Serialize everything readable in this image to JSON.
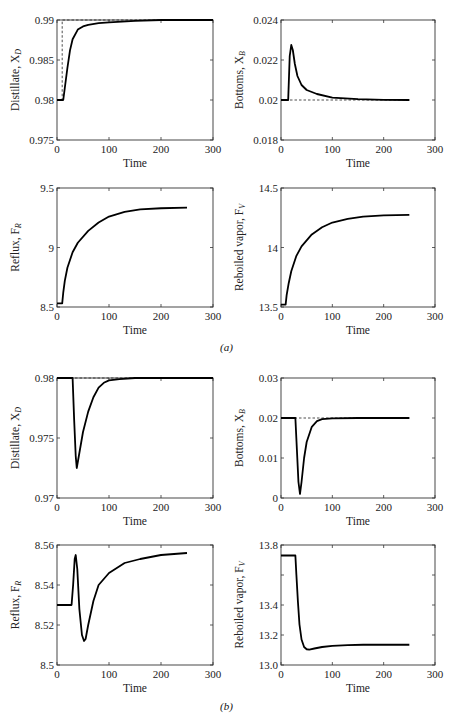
{
  "panel_labels": {
    "a": "(a)",
    "b": "(b)"
  },
  "chart_data": [
    {
      "id": "a_xd",
      "panel": "a",
      "type": "line",
      "ylabel": "Distillate, X",
      "ylabel_sub": "D",
      "xlabel": "Time",
      "xlim": [
        0,
        300
      ],
      "ylim": [
        0.975,
        0.99
      ],
      "xticks": [
        0,
        100,
        200,
        300
      ],
      "yticks": [
        0.975,
        0.98,
        0.985,
        0.99
      ],
      "xtick_labels": [
        "0",
        "100",
        "200",
        "300"
      ],
      "ytick_labels": [
        "0.975",
        "0.98",
        "0.985",
        "0.99"
      ],
      "frame": {
        "x0": 57,
        "y0": 20,
        "x1": 213,
        "y1": 140
      },
      "setpoint": {
        "x": [
          0,
          10,
          10,
          300
        ],
        "y": [
          0.98,
          0.98,
          0.99,
          0.99
        ]
      },
      "series": [
        {
          "name": "response",
          "x": [
            0,
            12,
            15,
            20,
            25,
            30,
            40,
            50,
            60,
            80,
            100,
            150,
            200,
            300
          ],
          "y": [
            0.98,
            0.98,
            0.9815,
            0.984,
            0.9862,
            0.9876,
            0.9888,
            0.9892,
            0.9894,
            0.9896,
            0.9897,
            0.9899,
            0.99,
            0.99
          ]
        }
      ]
    },
    {
      "id": "a_xb",
      "panel": "a",
      "type": "line",
      "ylabel": "Bottoms, X",
      "ylabel_sub": "B",
      "xlabel": "Time",
      "xlim": [
        0,
        300
      ],
      "ylim": [
        0.018,
        0.024
      ],
      "xticks": [
        0,
        100,
        200,
        300
      ],
      "yticks": [
        0.018,
        0.02,
        0.022,
        0.024
      ],
      "xtick_labels": [
        "0",
        "100",
        "200",
        "300"
      ],
      "ytick_labels": [
        "0.018",
        "0.02",
        "0.022",
        "0.024"
      ],
      "frame": {
        "x0": 281,
        "y0": 20,
        "x1": 435,
        "y1": 140
      },
      "setpoint": {
        "x": [
          0,
          250
        ],
        "y": [
          0.02,
          0.02
        ]
      },
      "series": [
        {
          "name": "response",
          "x": [
            0,
            14,
            17,
            20,
            23,
            27,
            32,
            40,
            50,
            70,
            100,
            150,
            200,
            250
          ],
          "y": [
            0.02,
            0.02,
            0.0222,
            0.02275,
            0.0225,
            0.0218,
            0.0212,
            0.02075,
            0.0205,
            0.0203,
            0.02012,
            0.02004,
            0.02001,
            0.02
          ]
        }
      ]
    },
    {
      "id": "a_fr",
      "panel": "a",
      "type": "line",
      "ylabel": "Reflux, F",
      "ylabel_sub": "R",
      "xlabel": "Time",
      "xlim": [
        0,
        300
      ],
      "ylim": [
        8.5,
        9.5
      ],
      "xticks": [
        0,
        100,
        200,
        300
      ],
      "yticks": [
        8.5,
        9,
        9.5
      ],
      "xtick_labels": [
        "0",
        "100",
        "200",
        "300"
      ],
      "ytick_labels": [
        "8.5",
        "9",
        "9.5"
      ],
      "frame": {
        "x0": 57,
        "y0": 188,
        "x1": 213,
        "y1": 307
      },
      "series": [
        {
          "name": "response",
          "x": [
            0,
            10,
            12,
            15,
            20,
            30,
            40,
            60,
            80,
            100,
            130,
            160,
            200,
            250
          ],
          "y": [
            8.53,
            8.53,
            8.62,
            8.72,
            8.83,
            8.96,
            9.04,
            9.14,
            9.21,
            9.26,
            9.3,
            9.32,
            9.33,
            9.335
          ]
        }
      ]
    },
    {
      "id": "a_fv",
      "panel": "a",
      "type": "line",
      "ylabel": "Reboiled vapor, F",
      "ylabel_sub": "V",
      "xlabel": "Time",
      "xlim": [
        0,
        300
      ],
      "ylim": [
        13.5,
        14.5
      ],
      "xticks": [
        0,
        100,
        200,
        300
      ],
      "yticks": [
        13.5,
        14,
        14.5
      ],
      "xtick_labels": [
        "0",
        "100",
        "200",
        "300"
      ],
      "ytick_labels": [
        "13.5",
        "14",
        "14.5"
      ],
      "frame": {
        "x0": 281,
        "y0": 188,
        "x1": 435,
        "y1": 307
      },
      "series": [
        {
          "name": "response",
          "x": [
            0,
            9,
            11,
            15,
            20,
            30,
            40,
            60,
            80,
            100,
            130,
            160,
            200,
            250
          ],
          "y": [
            13.52,
            13.52,
            13.6,
            13.7,
            13.8,
            13.93,
            14.01,
            14.11,
            14.17,
            14.21,
            14.24,
            14.26,
            14.27,
            14.275
          ]
        }
      ]
    },
    {
      "id": "b_xd",
      "panel": "b",
      "type": "line",
      "ylabel": "Distillate, X",
      "ylabel_sub": "D",
      "xlabel": "Time",
      "xlim": [
        0,
        300
      ],
      "ylim": [
        0.97,
        0.98
      ],
      "xticks": [
        0,
        100,
        200,
        300
      ],
      "yticks": [
        0.97,
        0.975,
        0.98
      ],
      "xtick_labels": [
        "0",
        "100",
        "200",
        "300"
      ],
      "ytick_labels": [
        "0.97",
        "0.975",
        "0.98"
      ],
      "frame": {
        "x0": 57,
        "y0": 378,
        "x1": 213,
        "y1": 498
      },
      "setpoint": {
        "x": [
          0,
          300
        ],
        "y": [
          0.98,
          0.98
        ]
      },
      "series": [
        {
          "name": "response",
          "x": [
            0,
            30,
            33,
            36,
            38,
            42,
            50,
            60,
            70,
            80,
            90,
            100,
            120,
            150,
            200,
            300
          ],
          "y": [
            0.98,
            0.98,
            0.9765,
            0.9735,
            0.9725,
            0.9735,
            0.9755,
            0.9772,
            0.9784,
            0.9792,
            0.9796,
            0.9798,
            0.9799,
            0.98,
            0.98,
            0.98
          ]
        }
      ]
    },
    {
      "id": "b_xb",
      "panel": "b",
      "type": "line",
      "ylabel": "Bottoms, X",
      "ylabel_sub": "B",
      "xlabel": "Time",
      "xlim": [
        0,
        300
      ],
      "ylim": [
        0,
        0.03
      ],
      "xticks": [
        0,
        100,
        200,
        300
      ],
      "yticks": [
        0,
        0.01,
        0.02,
        0.03
      ],
      "xtick_labels": [
        "0",
        "100",
        "200",
        "300"
      ],
      "ytick_labels": [
        "0",
        "0.01",
        "0.02",
        "0.03"
      ],
      "frame": {
        "x0": 281,
        "y0": 378,
        "x1": 435,
        "y1": 498
      },
      "setpoint": {
        "x": [
          0,
          250
        ],
        "y": [
          0.02,
          0.02
        ]
      },
      "series": [
        {
          "name": "response",
          "x": [
            0,
            28,
            31,
            34,
            37,
            40,
            45,
            50,
            60,
            70,
            80,
            100,
            150,
            250
          ],
          "y": [
            0.02,
            0.02,
            0.012,
            0.004,
            0.001,
            0.004,
            0.01,
            0.014,
            0.0178,
            0.0192,
            0.0197,
            0.0199,
            0.02,
            0.02
          ]
        }
      ]
    },
    {
      "id": "b_fr",
      "panel": "b",
      "type": "line",
      "ylabel": "Reflux, F",
      "ylabel_sub": "R",
      "xlabel": "Time",
      "xlim": [
        0,
        300
      ],
      "ylim": [
        8.5,
        8.56
      ],
      "xticks": [
        0,
        100,
        200,
        300
      ],
      "yticks": [
        8.5,
        8.52,
        8.54,
        8.56
      ],
      "xtick_labels": [
        "0",
        "100",
        "200",
        "300"
      ],
      "ytick_labels": [
        "8.5",
        "8.52",
        "8.54",
        "8.56"
      ],
      "frame": {
        "x0": 57,
        "y0": 545,
        "x1": 213,
        "y1": 665
      },
      "series": [
        {
          "name": "response",
          "x": [
            0,
            28,
            31,
            34,
            36,
            39,
            43,
            48,
            52,
            55,
            60,
            70,
            80,
            100,
            130,
            160,
            200,
            250
          ],
          "y": [
            8.53,
            8.53,
            8.54,
            8.553,
            8.555,
            8.548,
            8.528,
            8.515,
            8.512,
            8.513,
            8.52,
            8.532,
            8.54,
            8.546,
            8.551,
            8.553,
            8.555,
            8.556
          ]
        }
      ]
    },
    {
      "id": "b_fv",
      "panel": "b",
      "type": "line",
      "ylabel": "Reboiled vapor, F",
      "ylabel_sub": "V",
      "xlabel": "Time",
      "xlim": [
        0,
        300
      ],
      "ylim": [
        13.0,
        13.8
      ],
      "xticks": [
        0,
        100,
        200,
        300
      ],
      "yticks": [
        13.0,
        13.2,
        13.4,
        13.6,
        13.8
      ],
      "xtick_labels": [
        "0",
        "100",
        "200",
        "300"
      ],
      "ytick_labels": [
        "13.0",
        "",
        "13.2",
        "13.4",
        "13.8"
      ],
      "ytick_labels_shown": [
        {
          "v": 13.0,
          "t": "13.0"
        },
        {
          "v": 13.2,
          "t": "13.2"
        },
        {
          "v": 13.4,
          "t": "13.4"
        },
        {
          "v": 13.8,
          "t": "13.8"
        }
      ],
      "frame": {
        "x0": 281,
        "y0": 545,
        "x1": 435,
        "y1": 665
      },
      "series": [
        {
          "name": "response",
          "x": [
            0,
            28,
            30,
            33,
            36,
            40,
            45,
            50,
            55,
            65,
            80,
            100,
            130,
            160,
            200,
            250
          ],
          "y": [
            13.73,
            13.73,
            13.6,
            13.42,
            13.27,
            13.17,
            13.12,
            13.105,
            13.103,
            13.11,
            13.12,
            13.128,
            13.133,
            13.135,
            13.135,
            13.135
          ]
        }
      ]
    }
  ]
}
